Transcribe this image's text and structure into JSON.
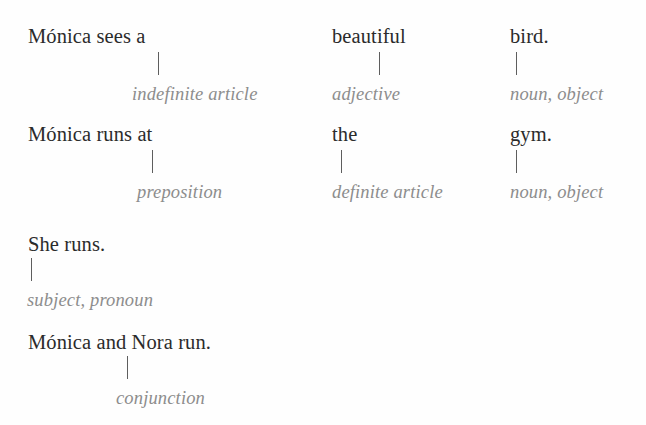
{
  "figure": {
    "kind": "grammar-annotation-diagram",
    "background_color": "#fefefe",
    "sentence_text_color": "#2b2b2b",
    "label_text_color": "#8d8d8d",
    "tick_color": "#5e5e5e",
    "blocks": [
      {
        "id": "block-1",
        "sentence": "Mónica sees a beautiful bird.",
        "segments": [
          {
            "word": "Mónica sees a",
            "label": "indefinite article"
          },
          {
            "word": "beautiful",
            "label": "adjective"
          },
          {
            "word": "bird.",
            "label": "noun, object"
          }
        ]
      },
      {
        "id": "block-2",
        "sentence": "Mónica runs at the gym.",
        "segments": [
          {
            "word": "Mónica runs at",
            "label": "preposition"
          },
          {
            "word": "the",
            "label": "definite article"
          },
          {
            "word": "gym.",
            "label": "noun, object"
          }
        ]
      },
      {
        "id": "block-3",
        "sentence": "She runs.",
        "segments": [
          {
            "word": "She runs.",
            "label": "subject, pronoun"
          }
        ]
      },
      {
        "id": "block-4",
        "sentence": "Mónica and Nora run.",
        "segments": [
          {
            "word": "Mónica and Nora run.",
            "label": "conjunction"
          }
        ]
      }
    ]
  }
}
